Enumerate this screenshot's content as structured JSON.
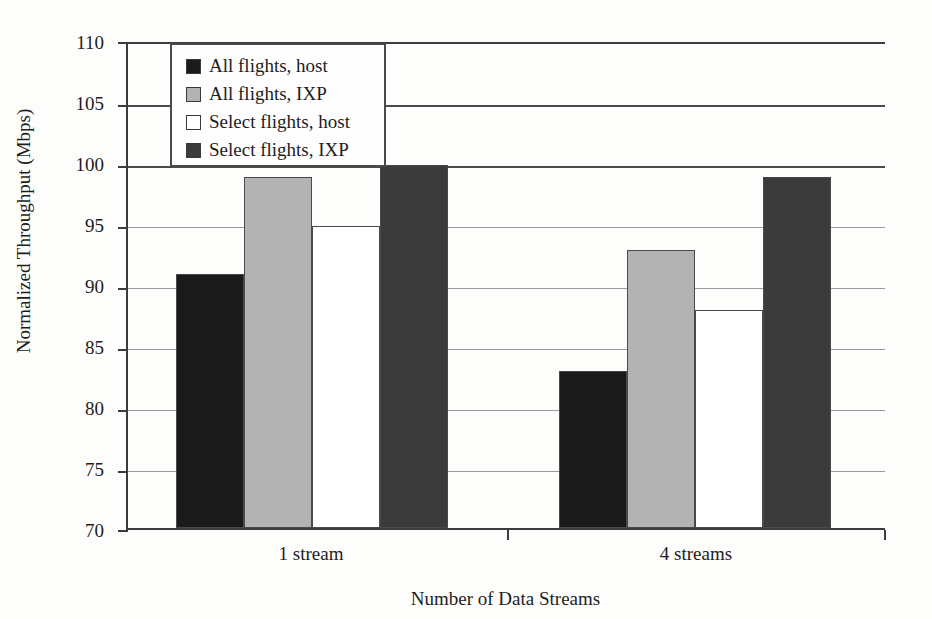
{
  "chart_data": {
    "type": "bar",
    "title": "",
    "xlabel": "Number of Data Streams",
    "ylabel": "Normalized Throughput (Mbps)",
    "categories": [
      "1 stream",
      "4 streams"
    ],
    "ylim": [
      70,
      110
    ],
    "ytick_step": 5,
    "yticks": [
      70,
      75,
      80,
      85,
      90,
      95,
      100,
      105,
      110
    ],
    "grid": true,
    "legend_position": "top-left-inside",
    "series": [
      {
        "name": "All flights, host",
        "color": "#1b1b1b",
        "values": [
          91,
          83
        ]
      },
      {
        "name": "All flights, IXP",
        "color": "#b3b3b3",
        "values": [
          99,
          93
        ]
      },
      {
        "name": "Select flights, host",
        "color": "#ffffff",
        "values": [
          95,
          88
        ]
      },
      {
        "name": "Select flights, IXP",
        "color": "#3b3b3b",
        "values": [
          100,
          99
        ]
      }
    ]
  },
  "axis": {
    "y_title": "Normalized Throughput (Mbps)",
    "x_title": "Number of Data Streams",
    "y_ticks": [
      "110",
      "105",
      "100",
      "95",
      "90",
      "85",
      "80",
      "75",
      "70"
    ],
    "x_ticks": [
      "1 stream",
      "4 streams"
    ]
  },
  "legend": {
    "items": [
      {
        "label": "All flights, host",
        "swatch": "black"
      },
      {
        "label": "All flights, IXP",
        "swatch": "light-gray"
      },
      {
        "label": "Select flights, host",
        "swatch": "white"
      },
      {
        "label": "Select flights, IXP",
        "swatch": "dark-gray"
      }
    ]
  }
}
